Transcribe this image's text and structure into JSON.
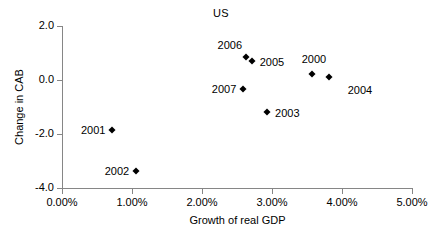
{
  "chart_data": {
    "type": "scatter",
    "title": "US",
    "xlabel": "Growth of real GDP",
    "ylabel": "Change in CAB",
    "xlim": [
      0,
      5
    ],
    "ylim": [
      -4,
      2
    ],
    "xticks": [
      "0.00%",
      "1.00%",
      "2.00%",
      "3.00%",
      "4.00%",
      "5.00%"
    ],
    "xtick_values": [
      0,
      1,
      2,
      3,
      4,
      5
    ],
    "yticks": [
      "2.0",
      "0.0",
      "-2.0",
      "-4.0"
    ],
    "ytick_values": [
      2,
      0,
      -2,
      -4
    ],
    "grid": false,
    "legend": "none",
    "marker": "diamond",
    "marker_color": "#000000",
    "points": [
      {
        "label": "2000",
        "x": 3.57,
        "y": 0.22,
        "label_pos": "above"
      },
      {
        "label": "2001",
        "x": 0.72,
        "y": -1.85,
        "label_pos": "left"
      },
      {
        "label": "2002",
        "x": 1.06,
        "y": -3.37,
        "label_pos": "left"
      },
      {
        "label": "2003",
        "x": 2.93,
        "y": -1.19,
        "label_pos": "right"
      },
      {
        "label": "2004",
        "x": 3.81,
        "y": 0.11,
        "label_pos": "right-low"
      },
      {
        "label": "2005",
        "x": 2.71,
        "y": 0.7,
        "label_pos": "right"
      },
      {
        "label": "2006",
        "x": 2.63,
        "y": 0.85,
        "label_pos": "upper-left"
      },
      {
        "label": "2007",
        "x": 2.59,
        "y": -0.33,
        "label_pos": "left"
      }
    ]
  },
  "axis": {
    "color": "#868686"
  }
}
